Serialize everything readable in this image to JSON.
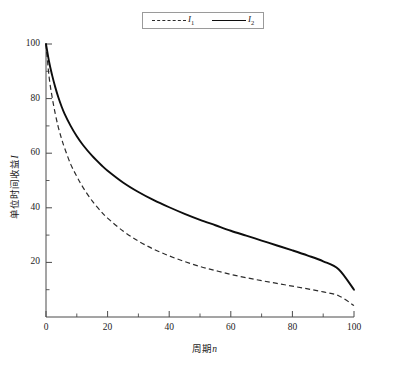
{
  "chart_data": {
    "type": "line",
    "title": "",
    "xlabel": "周期n",
    "ylabel": "单位时间收益I",
    "xlim": [
      0,
      100
    ],
    "ylim": [
      0,
      100
    ],
    "grid": false,
    "legend_position": "top-center",
    "x_ticks": [
      "0",
      "20",
      "40",
      "60",
      "80",
      "100"
    ],
    "x_tick_values": [
      0,
      20,
      40,
      60,
      80,
      100
    ],
    "x_minor_tick_values": [
      10,
      30,
      50,
      70,
      90
    ],
    "y_ticks": [
      "20",
      "40",
      "60",
      "80",
      "100"
    ],
    "y_tick_values": [
      20,
      40,
      60,
      80,
      100
    ],
    "y_minor_tick_values": [
      10,
      30,
      50,
      70,
      90
    ],
    "x": [
      0,
      1,
      2,
      3,
      4,
      5,
      6,
      8,
      10,
      12,
      15,
      18,
      20,
      25,
      30,
      35,
      40,
      45,
      50,
      55,
      60,
      65,
      70,
      75,
      80,
      85,
      90,
      95,
      100
    ],
    "series": [
      {
        "name": "I1",
        "label": "I₁",
        "style": "dashed",
        "color": "#2b2b2b",
        "values": [
          100,
          88,
          80.5,
          74.5,
          69.5,
          65.5,
          62,
          56,
          51.5,
          47.5,
          42.5,
          38.5,
          36.2,
          31.5,
          27.8,
          24.8,
          22.4,
          20.3,
          18.5,
          17,
          15.6,
          14.4,
          13.3,
          12.3,
          11.3,
          10.3,
          9.2,
          7.8,
          4.2
        ]
      },
      {
        "name": "I2",
        "label": "I₂",
        "style": "solid",
        "color": "#0d0d0d",
        "values": [
          100,
          93.5,
          88.5,
          84.2,
          80.5,
          77.3,
          74.5,
          70,
          66.2,
          63,
          59,
          55.6,
          53.6,
          49.3,
          45.8,
          42.8,
          40.2,
          37.8,
          35.6,
          33.6,
          31.6,
          29.8,
          28,
          26.2,
          24.4,
          22.5,
          20.4,
          17.5,
          10.0
        ]
      }
    ]
  },
  "legend": {
    "entries": [
      {
        "label": "I",
        "sub": "1",
        "style": "dashed"
      },
      {
        "label": "I",
        "sub": "2",
        "style": "solid"
      }
    ]
  },
  "axes": {
    "y_title_text": "单位时间收益",
    "y_title_italic": "I",
    "x_title_text": "周期",
    "x_title_italic": "n"
  }
}
